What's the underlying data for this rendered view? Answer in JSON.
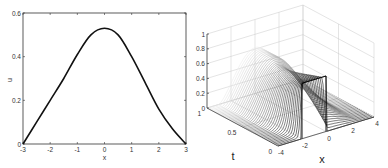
{
  "chart_data": [
    {
      "type": "line",
      "title": "",
      "xlabel": "x",
      "ylabel": "u",
      "xlim": [
        -3,
        3
      ],
      "ylim": [
        0,
        0.6
      ],
      "xticks": [
        "-3",
        "-2",
        "-1",
        "0",
        "1",
        "2",
        "3"
      ],
      "yticks": [
        "0",
        "0.2",
        "0.4",
        "0.6"
      ],
      "grid": false,
      "series": [
        {
          "name": "u(x)",
          "x": [
            -3,
            -2.5,
            -2,
            -1.5,
            -1,
            -0.5,
            0,
            0.5,
            1,
            1.5,
            2,
            2.5,
            3
          ],
          "values": [
            0,
            0.1,
            0.2,
            0.3,
            0.41,
            0.5,
            0.53,
            0.5,
            0.4,
            0.28,
            0.16,
            0.07,
            0
          ]
        }
      ]
    },
    {
      "type": "surface",
      "title": "",
      "xlabel": "x",
      "ylabel": "t",
      "zlabel": "",
      "xlim": [
        -4,
        4
      ],
      "ylim": [
        0,
        1
      ],
      "zlim": [
        0,
        1
      ],
      "xticks": [
        "-4",
        "-2",
        "0",
        "2",
        "4"
      ],
      "yticks": [
        "0",
        "0.5",
        "1"
      ],
      "zticks": [
        "0",
        "0.2",
        "0.4",
        "0.6",
        "0.8",
        "1"
      ],
      "grid": true,
      "description": "Mesh surface u(x,t): at t=0 a step of height ~0.75 on x in [-2,0] (nearly zero elsewhere); the profile smooths toward a bump of peak ~0.55-0.7 on [-3,3] as t increases to 1"
    }
  ],
  "left_plot": {
    "xlabel": "x",
    "ylabel": "u",
    "xticks": [
      "-3",
      "-2",
      "-1",
      "0",
      "1",
      "2",
      "3"
    ],
    "yticks": [
      "0",
      "0.2",
      "0.4",
      "0.6"
    ]
  },
  "right_plot": {
    "xlabel": "x",
    "tlabel": "t",
    "xticks": [
      "-4",
      "-2",
      "0",
      "2",
      "4"
    ],
    "tticks": [
      "0",
      "0.5",
      "1"
    ],
    "zticks": [
      "0",
      "0.2",
      "0.4",
      "0.6",
      "0.8",
      "1"
    ]
  }
}
